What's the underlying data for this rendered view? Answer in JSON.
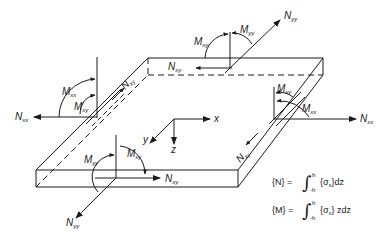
{
  "figure": {
    "stroke_color": "#1a1a1a",
    "background": "#ffffff"
  },
  "axes": {
    "x": "x",
    "y": "y",
    "z": "z"
  },
  "labels": {
    "nxx_left": {
      "main": "N",
      "sub": "xx"
    },
    "nxx_right": {
      "main": "N",
      "sub": "xx"
    },
    "nyy_top": {
      "main": "N",
      "sub": "yy"
    },
    "nyy_bottom": {
      "main": "N",
      "sub": "yy"
    },
    "nxy_left_edge": {
      "main": "N",
      "sub": "xy"
    },
    "nxy_back_edge": {
      "main": "N",
      "sub": "xy"
    },
    "nxy_right_edge": {
      "main": "N",
      "sub": "xy"
    },
    "nxy_front_edge": {
      "main": "N",
      "sub": "xy"
    },
    "mxx_left": {
      "main": "M",
      "sub": "xx"
    },
    "mxy_left": {
      "main": "M",
      "sub": "xy"
    },
    "mxy_back": {
      "main": "M",
      "sub": "xy"
    },
    "myy_back": {
      "main": "M",
      "sub": "yy"
    },
    "mxy_right": {
      "main": "M",
      "sub": "xy"
    },
    "mxx_right": {
      "main": "M",
      "sub": "xx"
    },
    "myy_front": {
      "main": "M",
      "sub": "yy"
    },
    "mxy_front": {
      "main": "M",
      "sub": "xy"
    }
  },
  "equations": [
    {
      "lhs": "{N} =",
      "upper": "h",
      "lower": "-h",
      "integrand": "{σ",
      "integrand_sub": "x",
      "tail": "}dz"
    },
    {
      "lhs": "{M} =",
      "upper": "h",
      "lower": "-h",
      "integrand": "{σ",
      "integrand_sub": "x",
      "tail": "} zdz"
    }
  ]
}
